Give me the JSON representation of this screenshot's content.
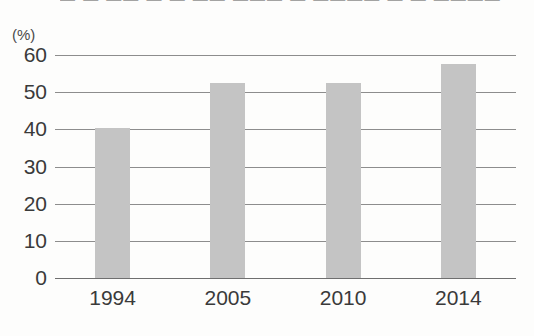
{
  "clipped_title": "— — —— — — —— ——— — ———— — — ————",
  "axis": {
    "unit_label": "(%)",
    "y_ticks": [
      "60",
      "50",
      "40",
      "30",
      "20",
      "10",
      "0"
    ],
    "x_ticks": [
      "1994",
      "2005",
      "2010",
      "2014"
    ]
  },
  "colors": {
    "bar_fill": "#c4c4c4",
    "gridline": "#8d8d8d",
    "text": "#3a3a3a",
    "background": "#fdfdfc"
  },
  "chart_data": {
    "type": "bar",
    "title": "",
    "xlabel": "",
    "ylabel": "(%)",
    "categories": [
      "1994",
      "2005",
      "2010",
      "2014"
    ],
    "values": [
      40.3,
      52.5,
      52.5,
      57.5
    ],
    "ylim": [
      0,
      60
    ],
    "yticks": [
      0,
      10,
      20,
      30,
      40,
      50,
      60
    ],
    "grid": true,
    "legend": "none",
    "series": [
      {
        "name": "",
        "values": [
          40.3,
          52.5,
          52.5,
          57.5
        ]
      }
    ]
  }
}
